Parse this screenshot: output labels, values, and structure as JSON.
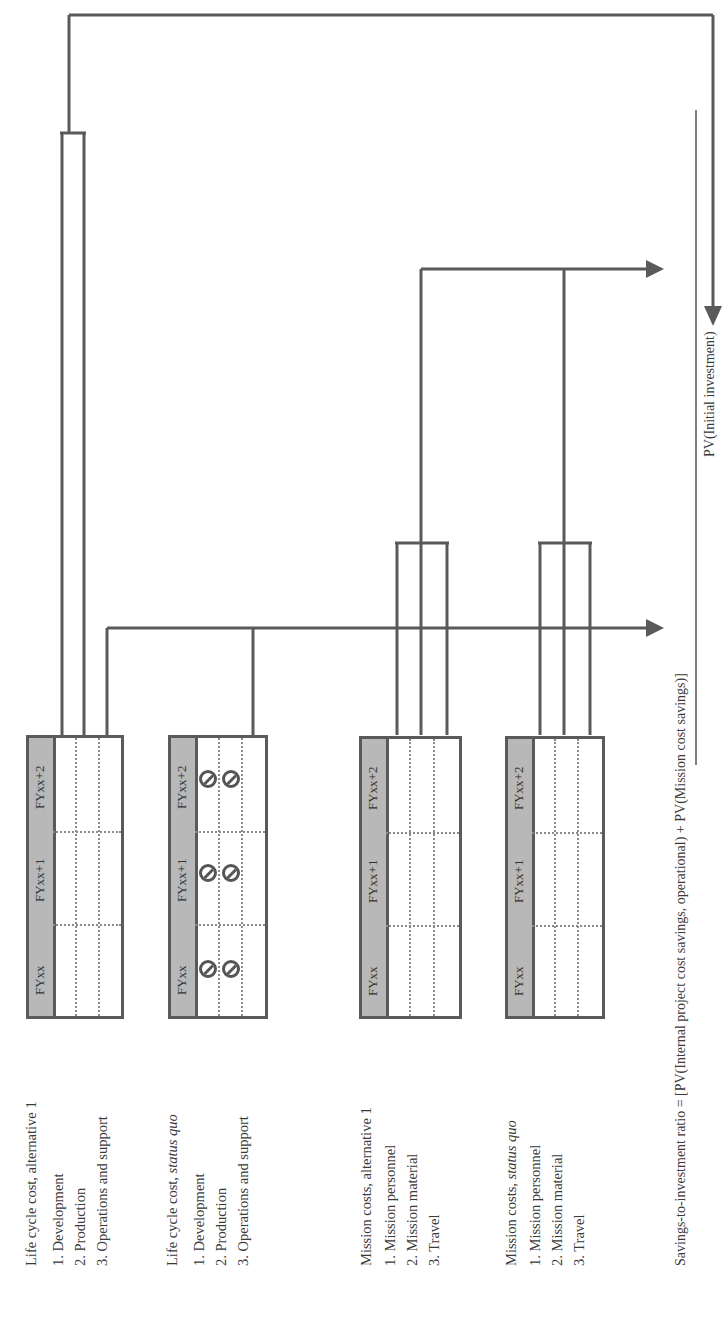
{
  "groups": [
    {
      "title_prefix": "Life cycle cost, ",
      "title_suffix": "alternative 1",
      "suffix_italic": false,
      "items": [
        "1. Development",
        "2. Production",
        "3. Operations and support"
      ]
    },
    {
      "title_prefix": "Life cycle cost, ",
      "title_suffix": "status quo",
      "suffix_italic": true,
      "items": [
        "1. Development",
        "2. Production",
        "3. Operations and support"
      ]
    },
    {
      "title_prefix": "Mission costs, ",
      "title_suffix": "alternative 1",
      "suffix_italic": false,
      "items": [
        "1. Mission personnel",
        "2. Mission material",
        "3. Travel"
      ]
    },
    {
      "title_prefix": "Mission costs, ",
      "title_suffix": "status quo",
      "suffix_italic": true,
      "items": [
        "1. Mission personnel",
        "2. Mission material",
        "3. Travel"
      ]
    }
  ],
  "table_headers": [
    "FYxx",
    "FYxx+1",
    "FYxx+2"
  ],
  "symbols": {
    "status_quo_life_cycle": "no-entry markers in Development and Production rows for each fiscal year"
  },
  "formula": {
    "lhs": "Savings-to-investment ratio = ",
    "numerator": "[PV(Internal project cost savings, operational) + PV(Mission cost savings)]",
    "denominator": "PV(Initial investment)"
  },
  "colors": {
    "line": "#5a5a5a",
    "header_fill": "#b8b8b8",
    "dotted": "#8a8a8a",
    "text": "#3a3a3a"
  }
}
